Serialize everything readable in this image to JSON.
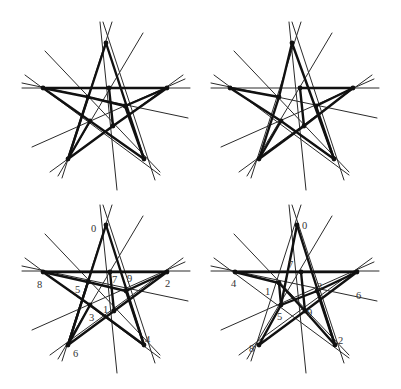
{
  "figure": {
    "panels": [
      {
        "id": "top-left",
        "offset": [
          0,
          0
        ],
        "points": [
          {
            "id": "a",
            "x": 106,
            "y": 43,
            "label": ""
          },
          {
            "id": "b",
            "x": 43,
            "y": 88,
            "label": ""
          },
          {
            "id": "c",
            "x": 167,
            "y": 88,
            "label": ""
          },
          {
            "id": "d",
            "x": 68,
            "y": 159,
            "label": ""
          },
          {
            "id": "e",
            "x": 144,
            "y": 159,
            "label": ""
          },
          {
            "id": "f",
            "x": 109,
            "y": 88,
            "label": ""
          },
          {
            "id": "g",
            "x": 88,
            "y": 97,
            "label": ""
          },
          {
            "id": "h",
            "x": 125,
            "y": 106,
            "label": ""
          },
          {
            "id": "i",
            "x": 90,
            "y": 121,
            "label": ""
          },
          {
            "id": "j",
            "x": 113,
            "y": 126,
            "label": ""
          }
        ],
        "thick_edges": [
          [
            "a",
            "e"
          ],
          [
            "a",
            "d"
          ],
          [
            "b",
            "f"
          ],
          [
            "f",
            "c"
          ],
          [
            "b",
            "g"
          ],
          [
            "g",
            "h"
          ],
          [
            "h",
            "c"
          ],
          [
            "c",
            "j"
          ],
          [
            "j",
            "d"
          ],
          [
            "g",
            "d"
          ],
          [
            "i",
            "e"
          ],
          [
            "b",
            "i"
          ],
          [
            "d",
            "i"
          ],
          [
            "h",
            "e"
          ],
          [
            "f",
            "j"
          ]
        ]
      },
      {
        "id": "top-right",
        "offset": [
          195,
          0
        ],
        "points": [
          {
            "id": "a",
            "x": 97,
            "y": 43,
            "label": ""
          },
          {
            "id": "b",
            "x": 35,
            "y": 88,
            "label": ""
          },
          {
            "id": "c",
            "x": 158,
            "y": 88,
            "label": ""
          },
          {
            "id": "d",
            "x": 64,
            "y": 159,
            "label": ""
          },
          {
            "id": "e",
            "x": 139,
            "y": 159,
            "label": ""
          },
          {
            "id": "f",
            "x": 105,
            "y": 88,
            "label": ""
          },
          {
            "id": "g",
            "x": 84,
            "y": 97,
            "label": ""
          },
          {
            "id": "h",
            "x": 121,
            "y": 106,
            "label": ""
          },
          {
            "id": "i",
            "x": 86,
            "y": 121,
            "label": ""
          },
          {
            "id": "j",
            "x": 109,
            "y": 126,
            "label": ""
          }
        ],
        "thick_edges": [
          [
            "a",
            "e"
          ],
          [
            "a",
            "g"
          ],
          [
            "g",
            "d"
          ],
          [
            "f",
            "c"
          ],
          [
            "b",
            "g"
          ],
          [
            "b",
            "i"
          ],
          [
            "i",
            "e"
          ],
          [
            "c",
            "j"
          ],
          [
            "j",
            "d"
          ],
          [
            "h",
            "e"
          ],
          [
            "h",
            "c"
          ],
          [
            "f",
            "j"
          ],
          [
            "i",
            "d"
          ]
        ]
      },
      {
        "id": "bottom-left",
        "offset": [
          0,
          195
        ],
        "points": [
          {
            "id": "0",
            "x": 106,
            "y": 30,
            "label": "0",
            "lx": 91,
            "ly": 37
          },
          {
            "id": "8",
            "x": 43,
            "y": 77,
            "label": "8",
            "lx": 37,
            "ly": 93
          },
          {
            "id": "2",
            "x": 167,
            "y": 77,
            "label": "2",
            "lx": 165,
            "ly": 92
          },
          {
            "id": "6",
            "x": 68,
            "y": 150,
            "label": "6",
            "lx": 73,
            "ly": 162
          },
          {
            "id": "4",
            "x": 144,
            "y": 150,
            "label": "4",
            "lx": 145,
            "ly": 148
          },
          {
            "id": "7",
            "x": 110,
            "y": 77,
            "label": "7",
            "lx": 112,
            "ly": 88
          },
          {
            "id": "5",
            "x": 88,
            "y": 87,
            "label": "5",
            "lx": 75,
            "ly": 98
          },
          {
            "id": "9",
            "x": 126,
            "y": 96,
            "label": "9",
            "lx": 127,
            "ly": 87
          },
          {
            "id": "3",
            "x": 90,
            "y": 110,
            "label": "3",
            "lx": 89,
            "ly": 126
          },
          {
            "id": "1",
            "x": 114,
            "y": 116,
            "label": "1",
            "lx": 103,
            "ly": 118
          }
        ],
        "thick_edges": [
          [
            "0",
            "4"
          ],
          [
            "0",
            "6"
          ],
          [
            "8",
            "7"
          ],
          [
            "7",
            "2"
          ],
          [
            "8",
            "5"
          ],
          [
            "5",
            "9"
          ],
          [
            "9",
            "2"
          ],
          [
            "2",
            "1"
          ],
          [
            "1",
            "6"
          ],
          [
            "5",
            "6"
          ],
          [
            "3",
            "4"
          ],
          [
            "8",
            "3"
          ],
          [
            "6",
            "3"
          ],
          [
            "9",
            "4"
          ],
          [
            "7",
            "1"
          ]
        ]
      },
      {
        "id": "bottom-right",
        "offset": [
          195,
          195
        ],
        "points": [
          {
            "id": "0",
            "x": 102,
            "y": 30,
            "label": "0",
            "lx": 107,
            "ly": 34
          },
          {
            "id": "4",
            "x": 40,
            "y": 77,
            "label": "4",
            "lx": 36,
            "ly": 92
          },
          {
            "id": "r",
            "x": 162,
            "y": 77,
            "label": ""
          },
          {
            "id": "8",
            "x": 64,
            "y": 150,
            "label": "8",
            "lx": 54,
            "ly": 157
          },
          {
            "id": "2",
            "x": 140,
            "y": 150,
            "label": "2",
            "lx": 143,
            "ly": 149
          },
          {
            "id": "7",
            "x": 106,
            "y": 77,
            "label": "7",
            "lx": 93,
            "ly": 73
          },
          {
            "id": "1",
            "x": 84,
            "y": 88,
            "label": "1",
            "lx": 70,
            "ly": 100
          },
          {
            "id": "3",
            "x": 122,
            "y": 96,
            "label": "3",
            "lx": 122,
            "ly": 95
          },
          {
            "id": "5",
            "x": 86,
            "y": 110,
            "label": "5",
            "lx": 82,
            "ly": 125
          },
          {
            "id": "9",
            "x": 110,
            "y": 116,
            "label": "9",
            "lx": 112,
            "ly": 121
          }
        ],
        "extra_labels": [
          {
            "label": "6",
            "lx": 161,
            "ly": 104
          }
        ],
        "thick_edges": [
          [
            "0",
            "2"
          ],
          [
            "0",
            "5"
          ],
          [
            "5",
            "8"
          ],
          [
            "4",
            "1"
          ],
          [
            "1",
            "9"
          ],
          [
            "9",
            "2"
          ],
          [
            "4",
            "7"
          ],
          [
            "7",
            "r"
          ],
          [
            "r",
            "3"
          ],
          [
            "3",
            "5"
          ],
          [
            "r",
            "9"
          ],
          [
            "9",
            "8"
          ],
          [
            "7",
            "9"
          ],
          [
            "3",
            "2"
          ],
          [
            "5",
            "1"
          ]
        ]
      }
    ],
    "thin_lines_template": [
      {
        "x1": 100,
        "y1": 22,
        "x2": 117,
        "y2": 190
      },
      {
        "x1": 112,
        "y1": 22,
        "x2": 62,
        "y2": 178
      },
      {
        "x1": 103,
        "y1": 22,
        "x2": 155,
        "y2": 180
      },
      {
        "x1": 22,
        "y1": 88,
        "x2": 190,
        "y2": 88
      },
      {
        "x1": 22,
        "y1": 83,
        "x2": 188,
        "y2": 118
      },
      {
        "x1": 25,
        "y1": 75,
        "x2": 160,
        "y2": 175
      },
      {
        "x1": 45,
        "y1": 51,
        "x2": 160,
        "y2": 172
      },
      {
        "x1": 143,
        "y1": 33,
        "x2": 58,
        "y2": 176
      },
      {
        "x1": 183,
        "y1": 75,
        "x2": 50,
        "y2": 172
      },
      {
        "x1": 185,
        "y1": 79,
        "x2": 32,
        "y2": 147
      }
    ]
  }
}
